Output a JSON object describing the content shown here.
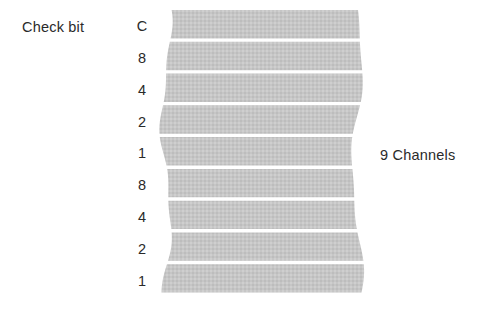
{
  "diagram": {
    "title_left": "Check bit",
    "title_right": "9 Channels",
    "band_color": "#c6c6c6",
    "text_color": "#2a2a2a",
    "background_color": "#ffffff",
    "track_count": 9,
    "tracks": [
      {
        "label": "C",
        "y": 26
      },
      {
        "label": "8",
        "y": 58
      },
      {
        "label": "4",
        "y": 90
      },
      {
        "label": "2",
        "y": 122
      },
      {
        "label": "1",
        "y": 153
      },
      {
        "label": "8",
        "y": 185
      },
      {
        "label": "4",
        "y": 217
      },
      {
        "label": "2",
        "y": 249
      },
      {
        "label": "1",
        "y": 281
      }
    ]
  },
  "chart_data": {
    "type": "bar",
    "categories": [
      "C",
      "8",
      "4",
      "2",
      "1",
      "8",
      "4",
      "2",
      "1"
    ],
    "values": [
      1,
      1,
      1,
      1,
      1,
      1,
      1,
      1,
      1
    ],
    "xlabel": "",
    "ylabel": "Check bit",
    "annotations": [
      "Check bit",
      "9 Channels"
    ],
    "legend": []
  }
}
